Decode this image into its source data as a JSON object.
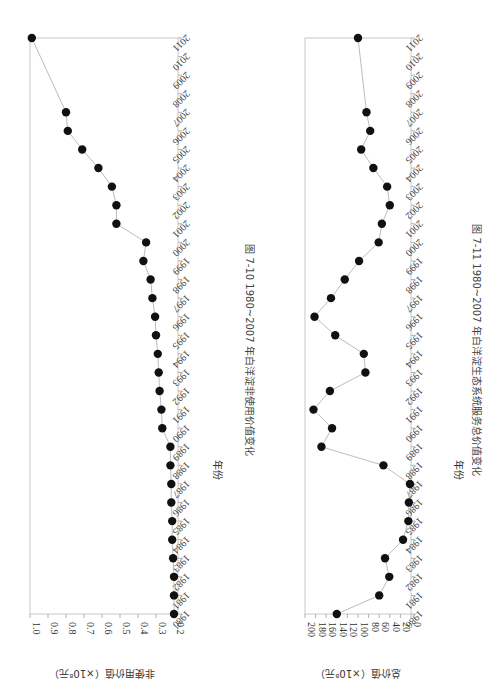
{
  "chart_data": [
    {
      "type": "line",
      "title": "图 7-10  1980~2007 年白洋淀非使用价值变化",
      "xlabel": "年份",
      "ylabel": "非使用价值（×10⁸元）",
      "x_ticks": [
        "1980",
        "1981",
        "1982",
        "1983",
        "1984",
        "1985",
        "1986",
        "1987",
        "1988",
        "1989",
        "1990",
        "1991",
        "1992",
        "1993",
        "1994",
        "1995",
        "1996",
        "1997",
        "1998",
        "1999",
        "2000",
        "2001",
        "2002",
        "2003",
        "2004",
        "2005",
        "2006",
        "2007",
        "2008",
        "2009",
        "2010",
        "2011"
      ],
      "y_ticks": [
        "0.2",
        "0.3",
        "0.4",
        "0.5",
        "0.6",
        "0.7",
        "0.8",
        "0.9",
        "1.0"
      ],
      "ylim": [
        0.2,
        1.0
      ],
      "xlim": [
        1980,
        2011
      ],
      "grid": false,
      "orientation": "page rotated 90° clockwise",
      "x": [
        1980,
        1981,
        1982,
        1983,
        1984,
        1985,
        1986,
        1987,
        1988,
        1989,
        1990,
        1991,
        1992,
        1993,
        1994,
        1995,
        1996,
        1997,
        1998,
        1999,
        2000,
        2001,
        2002,
        2003,
        2004,
        2005,
        2006,
        2007,
        2011
      ],
      "values": [
        0.2,
        0.2,
        0.2,
        0.205,
        0.21,
        0.21,
        0.215,
        0.215,
        0.22,
        0.22,
        0.265,
        0.27,
        0.28,
        0.285,
        0.29,
        0.3,
        0.305,
        0.32,
        0.33,
        0.37,
        0.355,
        0.52,
        0.52,
        0.545,
        0.62,
        0.71,
        0.79,
        0.8,
        0.99
      ]
    },
    {
      "type": "line",
      "title": "图 7-11  1980~2007 年白洋淀生态系统服务总价值变化",
      "xlabel": "年份",
      "ylabel": "总价值（×10⁸元）",
      "x_ticks": [
        "1980",
        "1981",
        "1982",
        "1983",
        "1984",
        "1985",
        "1986",
        "1987",
        "1988",
        "1989",
        "1990",
        "1991",
        "1992",
        "1993",
        "1994",
        "1995",
        "1996",
        "1997",
        "1998",
        "1999",
        "2000",
        "2001",
        "2002",
        "2003",
        "2004",
        "2005",
        "2006",
        "2007",
        "2008",
        "2009",
        "2010",
        "2011"
      ],
      "y_ticks": [
        "0",
        "20",
        "40",
        "60",
        "80",
        "100",
        "120",
        "140",
        "160",
        "180",
        "200"
      ],
      "ylim": [
        0,
        200
      ],
      "xlim": [
        1980,
        2011
      ],
      "grid": false,
      "orientation": "page rotated 90° clockwise",
      "x": [
        1980,
        1981,
        1982,
        1983,
        1984,
        1985,
        1986,
        1987,
        1988,
        1989,
        1990,
        1991,
        1992,
        1993,
        1994,
        1995,
        1996,
        1997,
        1998,
        1999,
        2000,
        2001,
        2002,
        2003,
        2004,
        2005,
        2006,
        2007,
        2011
      ],
      "values": [
        140,
        60,
        41,
        49,
        15,
        5,
        4,
        2,
        52,
        169,
        149,
        184,
        153,
        86,
        89,
        143,
        182,
        151,
        125,
        98,
        61,
        55,
        40,
        45,
        71,
        94,
        77,
        84,
        100
      ]
    }
  ]
}
